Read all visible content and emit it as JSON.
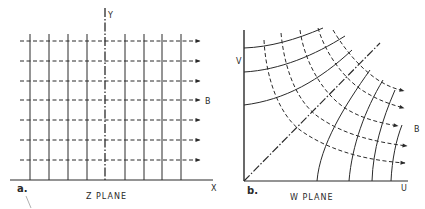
{
  "figure": {
    "panel_a": {
      "tag": "a.",
      "caption": "Z PLANE",
      "x_axis_label": "X",
      "y_axis_label": "Y",
      "field_label": "B",
      "vertical_lines_x": [
        30,
        49,
        68,
        87,
        125,
        144,
        162,
        181
      ],
      "field_arrows_y": [
        41,
        61,
        81,
        100,
        120,
        140,
        160
      ]
    },
    "panel_b": {
      "tag": "b.",
      "caption": "W PLANE",
      "x_axis_label": "U",
      "y_axis_label": "V",
      "field_label": "B"
    },
    "colors": {
      "ink": "#2a2a2a",
      "background": "#ffffff"
    }
  }
}
